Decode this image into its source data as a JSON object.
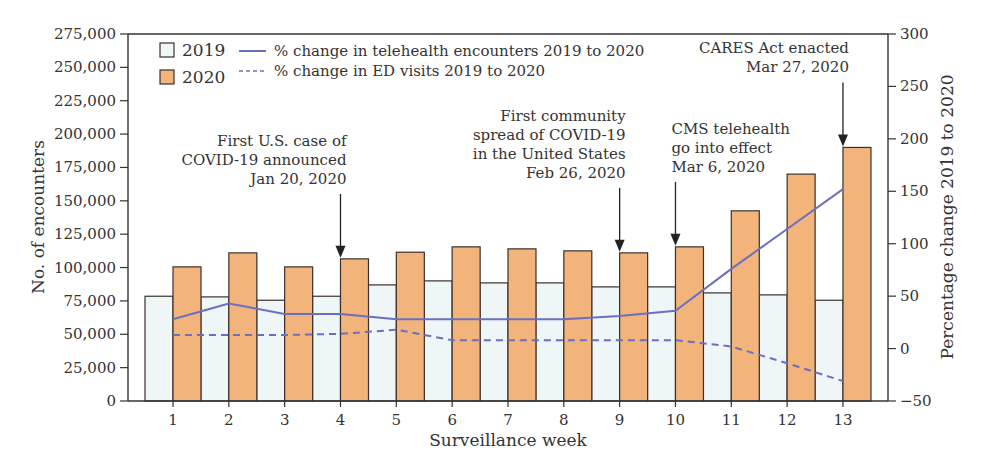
{
  "chart_data": {
    "type": "bar",
    "title": "",
    "xlabel": "Surveillance week",
    "ylabel": "No. of encounters",
    "y2label": "Percentage change 2019 to 2020",
    "categories": [
      "1",
      "2",
      "3",
      "4",
      "5",
      "6",
      "7",
      "8",
      "9",
      "10",
      "11",
      "12",
      "13"
    ],
    "ylim": [
      0,
      275000
    ],
    "y2lim": [
      -50,
      300
    ],
    "yticks": [
      0,
      25000,
      50000,
      75000,
      100000,
      125000,
      150000,
      175000,
      200000,
      225000,
      250000,
      275000
    ],
    "ytick_labels": [
      "0",
      "25,000",
      "50,000",
      "75,000",
      "100,000",
      "125,000",
      "150,000",
      "175,000",
      "200,000",
      "225,000",
      "250,000",
      "275,000"
    ],
    "y2ticks": [
      -50,
      0,
      50,
      100,
      150,
      200,
      250,
      300
    ],
    "y2tick_labels": [
      "−50",
      "0",
      "50",
      "100",
      "150",
      "200",
      "250",
      "300"
    ],
    "grid": false,
    "legend_position": "top-left",
    "series": [
      {
        "name": "2019",
        "type": "bar",
        "axis": "left",
        "color": "#eef6f8",
        "values": [
          78500,
          78000,
          75500,
          78500,
          87000,
          90000,
          88500,
          88500,
          85500,
          85500,
          81000,
          79500,
          75500
        ]
      },
      {
        "name": "2020",
        "type": "bar",
        "axis": "left",
        "color": "#f2b47a",
        "values": [
          100500,
          111000,
          100500,
          106500,
          111500,
          115500,
          114000,
          112500,
          111000,
          115500,
          142500,
          170000,
          190000
        ]
      },
      {
        "name": "% change in telehealth encounters 2019 to 2020",
        "type": "line",
        "axis": "right",
        "style": "solid",
        "color": "#6a6fc0",
        "values": [
          28,
          43,
          33,
          33,
          28,
          28,
          28,
          28,
          31,
          36,
          76,
          114,
          152
        ]
      },
      {
        "name": "% change in ED visits 2019 to 2020",
        "type": "line",
        "axis": "right",
        "style": "dashed",
        "color": "#6a6fc0",
        "values": [
          13,
          13,
          13,
          14,
          18,
          8,
          8,
          8,
          8,
          8,
          2,
          -14,
          -31
        ]
      }
    ],
    "annotations": [
      {
        "week": 4,
        "lines": [
          "First U.S. case of",
          "COVID-19 announced",
          "Jan 20, 2020"
        ],
        "align": "right"
      },
      {
        "week": 9,
        "lines": [
          "First community",
          "spread of COVID-19",
          "in the United States",
          "Feb 26, 2020"
        ],
        "align": "right"
      },
      {
        "week": 10,
        "lines": [
          "CMS telehealth",
          "go into effect",
          "Mar 6, 2020"
        ],
        "align": "left"
      },
      {
        "week": 13,
        "lines": [
          "CARES Act enacted",
          "Mar 27, 2020"
        ],
        "align": "right"
      }
    ]
  },
  "legend": {
    "bar_2019": "2019",
    "bar_2020": "2020",
    "line_telehealth": "% change in telehealth encounters 2019 to 2020",
    "line_ed": "% change in ED visits 2019 to 2020"
  },
  "colors": {
    "bar_2019": "#eef6f8",
    "bar_2020": "#f2b47a",
    "bar_stroke": "#3a3030",
    "line": "#6a6fc0",
    "axis": "#333333"
  }
}
